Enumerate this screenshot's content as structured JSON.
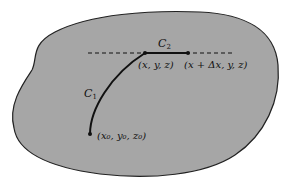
{
  "diagram": {
    "region_fill": "#a6a6a6",
    "outline_color": "#222222",
    "curves": {
      "c1": {
        "label": "C",
        "subscript": "1"
      },
      "c2": {
        "label": "C",
        "subscript": "2"
      }
    },
    "points": {
      "start": {
        "label": "(x₀, y₀, z₀)"
      },
      "mid": {
        "label": "(x, y, z)"
      },
      "end": {
        "label": "(x + Δx, y, z)"
      }
    }
  }
}
